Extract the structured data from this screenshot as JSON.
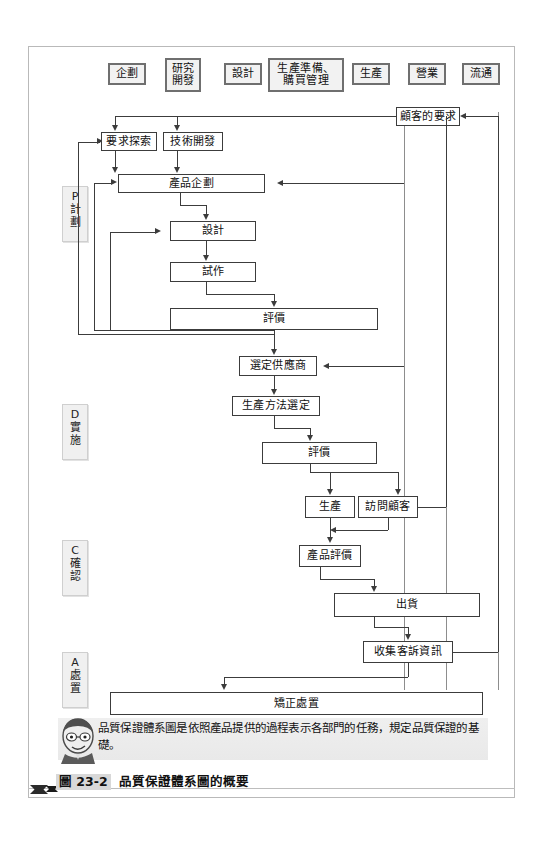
{
  "figure": {
    "number": "圖 23-2",
    "title": "品質保證體系圖的概要"
  },
  "note": {
    "text": "品質保證體系圖是依照產品提供的過程表示各部門的任務，規定品質保證的基礎。"
  },
  "departments": [
    {
      "id": "planning",
      "lines": [
        "企劃"
      ]
    },
    {
      "id": "rnd",
      "lines": [
        "研究",
        "開發"
      ]
    },
    {
      "id": "design",
      "lines": [
        "設計"
      ]
    },
    {
      "id": "prod-prep",
      "lines": [
        "生產準備、",
        "購買管理"
      ]
    },
    {
      "id": "production",
      "lines": [
        "生產"
      ]
    },
    {
      "id": "sales",
      "lines": [
        "營業"
      ]
    },
    {
      "id": "logistics",
      "lines": [
        "流通"
      ]
    }
  ],
  "phases": [
    {
      "id": "P",
      "letter": "P",
      "name1": "計",
      "name2": "劃"
    },
    {
      "id": "D",
      "letter": "D",
      "name1": "實",
      "name2": "施"
    },
    {
      "id": "C",
      "letter": "C",
      "name1": "確",
      "name2": "認"
    },
    {
      "id": "A",
      "letter": "A",
      "name1": "處",
      "name2": "置"
    }
  ],
  "nodes": {
    "customer_req": "顧客的要求",
    "req_explore": "要求探索",
    "tech_dev": "技術開發",
    "product_plan": "產品企劃",
    "design": "設計",
    "prototype": "試作",
    "eval_plan": "評價",
    "select_supplier": "選定供應商",
    "prod_method": "生產方法選定",
    "eval_do": "評價",
    "production": "生產",
    "visit_customer": "訪問顧客",
    "product_eval": "產品評價",
    "shipment": "出貨",
    "collect_claims": "收集客訴資訊",
    "corrective": "矯正處置"
  },
  "colors": {
    "line": "#3c3c3c",
    "column_divider": "#8d8d8d",
    "dept_border": "#6f6f6f",
    "dept_fill": "#f2f2f2",
    "phase_fill": "#f0f0f0",
    "note_fill": "#ececec",
    "frame": "#b9b9b9"
  }
}
